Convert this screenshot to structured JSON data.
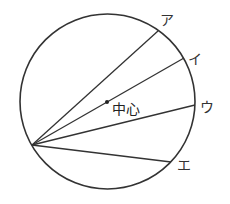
{
  "diagram": {
    "type": "circle-chords",
    "circle": {
      "cx": 107.5,
      "cy": 101.5,
      "r": 87.5,
      "stroke": "#333333"
    },
    "vertex": {
      "x": 32,
      "y": 145
    },
    "center_point": {
      "x": 107,
      "y": 102,
      "label": "中心"
    },
    "chords": [
      {
        "label": "ア",
        "end": {
          "x": 158,
          "y": 31
        },
        "label_pos": {
          "x": 160,
          "y": 25
        }
      },
      {
        "label": "イ",
        "end": {
          "x": 184,
          "y": 58
        },
        "label_pos": {
          "x": 188,
          "y": 64
        }
      },
      {
        "label": "ウ",
        "end": {
          "x": 195,
          "y": 105
        },
        "label_pos": {
          "x": 200,
          "y": 112
        }
      },
      {
        "label": "エ",
        "end": {
          "x": 171,
          "y": 162
        },
        "label_pos": {
          "x": 177,
          "y": 170
        }
      }
    ]
  }
}
